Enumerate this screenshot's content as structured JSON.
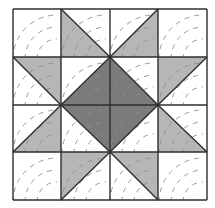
{
  "diagram": {
    "grid": {
      "rows": 4,
      "cols": 4,
      "x_lines": [
        13,
        61,
        110,
        158,
        207
      ],
      "y_lines": [
        9,
        57,
        105,
        152,
        200
      ]
    },
    "colors": {
      "background": "#ffffff",
      "light_fabric": "#b6b6b6",
      "dark_fabric": "#7b7b7b",
      "seam_line": "#2e2e2e",
      "quilting_stitch": "#8f8f8f"
    },
    "triangles": [
      {
        "cell": "r0c1",
        "fill": "light",
        "points": [
          [
            61,
            9
          ],
          [
            61,
            57
          ],
          [
            110,
            57
          ]
        ]
      },
      {
        "cell": "r0c2",
        "fill": "light",
        "points": [
          [
            158,
            9
          ],
          [
            158,
            57
          ],
          [
            110,
            57
          ]
        ]
      },
      {
        "cell": "r1c0",
        "fill": "light",
        "points": [
          [
            13,
            57
          ],
          [
            61,
            57
          ],
          [
            61,
            105
          ]
        ]
      },
      {
        "cell": "r1c3",
        "fill": "light",
        "points": [
          [
            207,
            57
          ],
          [
            158,
            57
          ],
          [
            158,
            105
          ]
        ]
      },
      {
        "cell": "r2c0",
        "fill": "light",
        "points": [
          [
            13,
            152
          ],
          [
            61,
            152
          ],
          [
            61,
            105
          ]
        ]
      },
      {
        "cell": "r2c3",
        "fill": "light",
        "points": [
          [
            207,
            152
          ],
          [
            158,
            152
          ],
          [
            158,
            105
          ]
        ]
      },
      {
        "cell": "r3c1",
        "fill": "light",
        "points": [
          [
            61,
            200
          ],
          [
            61,
            152
          ],
          [
            110,
            152
          ]
        ]
      },
      {
        "cell": "r3c2",
        "fill": "light",
        "points": [
          [
            158,
            200
          ],
          [
            158,
            152
          ],
          [
            110,
            152
          ]
        ]
      },
      {
        "cell": "r1c1",
        "fill": "dark",
        "points": [
          [
            61,
            105
          ],
          [
            110,
            57
          ],
          [
            110,
            105
          ]
        ]
      },
      {
        "cell": "r1c2",
        "fill": "dark",
        "points": [
          [
            110,
            57
          ],
          [
            158,
            105
          ],
          [
            110,
            105
          ]
        ]
      },
      {
        "cell": "r2c1",
        "fill": "dark",
        "points": [
          [
            61,
            105
          ],
          [
            110,
            105
          ],
          [
            110,
            152
          ]
        ]
      },
      {
        "cell": "r2c2",
        "fill": "dark",
        "points": [
          [
            110,
            105
          ],
          [
            158,
            105
          ],
          [
            110,
            152
          ]
        ]
      }
    ],
    "diagonals": [
      [
        [
          61,
          9
        ],
        [
          110,
          57
        ]
      ],
      [
        [
          158,
          9
        ],
        [
          110,
          57
        ]
      ],
      [
        [
          13,
          57
        ],
        [
          61,
          105
        ]
      ],
      [
        [
          207,
          57
        ],
        [
          158,
          105
        ]
      ],
      [
        [
          13,
          152
        ],
        [
          61,
          105
        ]
      ],
      [
        [
          207,
          152
        ],
        [
          158,
          105
        ]
      ],
      [
        [
          61,
          200
        ],
        [
          110,
          152
        ]
      ],
      [
        [
          158,
          200
        ],
        [
          110,
          152
        ]
      ],
      [
        [
          61,
          105
        ],
        [
          110,
          57
        ]
      ],
      [
        [
          110,
          57
        ],
        [
          158,
          105
        ]
      ],
      [
        [
          61,
          105
        ],
        [
          110,
          152
        ]
      ],
      [
        [
          158,
          105
        ],
        [
          110,
          152
        ]
      ]
    ],
    "quilting_arcs": {
      "description": "dashed concentric arcs centered on each cell's bottom-right region",
      "radii": [
        14,
        26,
        38
      ],
      "dash": "5 5"
    }
  }
}
